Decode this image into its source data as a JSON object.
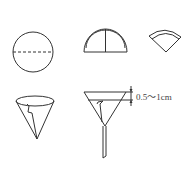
{
  "diagram": {
    "steps": [
      {
        "name": "circle",
        "label": ""
      },
      {
        "name": "half-fold",
        "label": ""
      },
      {
        "name": "quarter-fold",
        "label": ""
      },
      {
        "name": "opened-cone",
        "label": ""
      },
      {
        "name": "funnel-with-paper",
        "label": ""
      }
    ],
    "dimension_label": "0.5～1cm",
    "colors": {
      "line": "#333333",
      "background": "#ffffff"
    }
  }
}
